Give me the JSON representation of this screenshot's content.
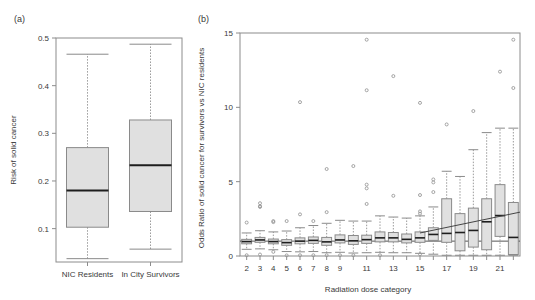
{
  "figure": {
    "panel_a_label": "(a)",
    "panel_b_label": "(b)"
  },
  "chart_data": [
    {
      "id": "panel-a",
      "type": "box",
      "title": "",
      "panel_label": "(a)",
      "xlabel": "",
      "ylabel": "Risk of solid cancer",
      "ylim": [
        0.03,
        0.5
      ],
      "yticks": [
        0.1,
        0.2,
        0.3,
        0.4,
        0.5
      ],
      "ytick_labels": [
        "0.1",
        "0.2",
        "0.3",
        "0.4",
        "0.5"
      ],
      "categories": [
        "NIC Residents",
        "In City Survivors"
      ],
      "grid": false,
      "legend": "none",
      "boxes": [
        {
          "category": "NIC Residents",
          "whisker_low": 0.037,
          "q1": 0.103,
          "median": 0.18,
          "q3": 0.27,
          "whisker_high": 0.466,
          "outliers": []
        },
        {
          "category": "In City Survivors",
          "whisker_low": 0.057,
          "q1": 0.136,
          "median": 0.233,
          "q3": 0.328,
          "whisker_high": 0.487,
          "outliers": []
        }
      ]
    },
    {
      "id": "panel-b",
      "type": "box",
      "title": "",
      "panel_label": "(b)",
      "xlabel": "Radiation dose category",
      "ylabel": "Odds Ratio of solid cancer for survivors vs NIC residents",
      "ylim": [
        0,
        15
      ],
      "yticks": [
        0,
        5,
        10,
        15
      ],
      "ytick_labels": [
        "0",
        "5",
        "10",
        "15"
      ],
      "categories": [
        "2",
        "3",
        "4",
        "5",
        "6",
        "7",
        "8",
        "9",
        "10",
        "11",
        "12",
        "13",
        "14",
        "15",
        "16",
        "17",
        "18",
        "19",
        "20",
        "21",
        "22"
      ],
      "xtick_labels_shown": [
        "2",
        "3",
        "4",
        "5",
        "6",
        "7",
        "8",
        "9",
        "",
        "11",
        "",
        "13",
        "",
        "15",
        "",
        "17",
        "",
        "19",
        "",
        "21",
        ""
      ],
      "reference_line_y": 1.0,
      "trend_line": {
        "x_start_category": "15",
        "x_end_category": "22",
        "y_start": 1.55,
        "y_end": 2.95
      },
      "grid": false,
      "legend": "none",
      "boxes": [
        {
          "category": "2",
          "whisker_low": 0.45,
          "q1": 0.82,
          "median": 0.97,
          "q3": 1.12,
          "whisker_high": 1.55,
          "outliers": [
            2.25,
            0.05
          ]
        },
        {
          "category": "3",
          "whisker_low": 0.48,
          "q1": 0.92,
          "median": 1.08,
          "q3": 1.25,
          "whisker_high": 1.7,
          "outliers": [
            3.55,
            3.35,
            3.3,
            0.1
          ]
        },
        {
          "category": "4",
          "whisker_low": 0.42,
          "q1": 0.82,
          "median": 0.97,
          "q3": 1.14,
          "whisker_high": 1.62,
          "outliers": [
            2.35,
            2.28,
            0.28
          ]
        },
        {
          "category": "5",
          "whisker_low": 0.3,
          "q1": 0.72,
          "median": 0.9,
          "q3": 1.1,
          "whisker_high": 1.68,
          "outliers": [
            2.35,
            0.04
          ]
        },
        {
          "category": "6",
          "whisker_low": 0.28,
          "q1": 0.82,
          "median": 1.0,
          "q3": 1.22,
          "whisker_high": 1.9,
          "outliers": [
            10.35,
            2.8,
            0.05
          ]
        },
        {
          "category": "7",
          "whisker_low": 0.3,
          "q1": 0.85,
          "median": 1.05,
          "q3": 1.28,
          "whisker_high": 2.05,
          "outliers": [
            2.35,
            0.05
          ]
        },
        {
          "category": "8",
          "whisker_low": 0.22,
          "q1": 0.72,
          "median": 0.95,
          "q3": 1.25,
          "whisker_high": 2.2,
          "outliers": [
            5.85,
            2.95,
            0.05
          ]
        },
        {
          "category": "9",
          "whisker_low": 0.25,
          "q1": 0.88,
          "median": 1.08,
          "q3": 1.42,
          "whisker_high": 2.4,
          "outliers": [
            0.05
          ]
        },
        {
          "category": "10",
          "whisker_low": 0.2,
          "q1": 0.78,
          "median": 1.02,
          "q3": 1.38,
          "whisker_high": 2.35,
          "outliers": [
            6.05,
            0.05
          ]
        },
        {
          "category": "11",
          "whisker_low": 0.22,
          "q1": 0.85,
          "median": 1.1,
          "q3": 1.4,
          "whisker_high": 2.35,
          "outliers": [
            14.55,
            11.15,
            4.8,
            4.55,
            3.5
          ]
        },
        {
          "category": "12",
          "whisker_low": 0.25,
          "q1": 0.95,
          "median": 1.22,
          "q3": 1.62,
          "whisker_high": 2.7,
          "outliers": [
            0.05
          ]
        },
        {
          "category": "13",
          "whisker_low": 0.22,
          "q1": 0.95,
          "median": 1.22,
          "q3": 1.58,
          "whisker_high": 2.62,
          "outliers": [
            12.1,
            4.05
          ]
        },
        {
          "category": "14",
          "whisker_low": 0.22,
          "q1": 0.88,
          "median": 1.12,
          "q3": 1.48,
          "whisker_high": 2.55,
          "outliers": []
        },
        {
          "category": "15",
          "whisker_low": 0.18,
          "q1": 0.92,
          "median": 1.22,
          "q3": 1.62,
          "whisker_high": 2.7,
          "outliers": [
            10.3,
            4.1,
            3.0,
            2.85,
            0.12
          ]
        },
        {
          "category": "16",
          "whisker_low": 0.12,
          "q1": 1.05,
          "median": 1.45,
          "q3": 1.9,
          "whisker_high": 3.3,
          "outliers": [
            5.15,
            4.95,
            4.3
          ]
        },
        {
          "category": "17",
          "whisker_low": 0.05,
          "q1": 0.92,
          "median": 1.52,
          "q3": 3.85,
          "whisker_high": 5.7,
          "outliers": [
            8.85
          ]
        },
        {
          "category": "18",
          "whisker_low": 0.05,
          "q1": 0.35,
          "median": 1.58,
          "q3": 2.85,
          "whisker_high": 5.35,
          "outliers": []
        },
        {
          "category": "19",
          "whisker_low": 0.05,
          "q1": 0.6,
          "median": 1.72,
          "q3": 3.22,
          "whisker_high": 7.15,
          "outliers": [
            9.75
          ]
        },
        {
          "category": "20",
          "whisker_low": 0.05,
          "q1": 0.42,
          "median": 2.3,
          "q3": 3.85,
          "whisker_high": 8.3,
          "outliers": []
        },
        {
          "category": "21",
          "whisker_low": 0.05,
          "q1": 1.32,
          "median": 2.72,
          "q3": 4.8,
          "whisker_high": 8.6,
          "outliers": [
            12.4
          ]
        },
        {
          "category": "22",
          "whisker_low": 0.05,
          "q1": 0.1,
          "median": 1.25,
          "q3": 3.6,
          "whisker_high": 8.6,
          "outliers": [
            14.55,
            11.3
          ]
        }
      ]
    }
  ]
}
